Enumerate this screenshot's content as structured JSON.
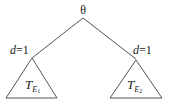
{
  "diagram": {
    "type": "tree",
    "root": {
      "label": "θ"
    },
    "branches": [
      {
        "edge_label_var": "d",
        "edge_label_eq": "=1",
        "subtree": {
          "base": "T",
          "sub": "E",
          "subsub": "1"
        }
      },
      {
        "edge_label_var": "d",
        "edge_label_eq": "=1",
        "subtree": {
          "base": "T",
          "sub": "E",
          "subsub": "2"
        }
      }
    ],
    "colors": {
      "line": "#555555",
      "text": "#222222",
      "background": "#ffffff"
    }
  }
}
